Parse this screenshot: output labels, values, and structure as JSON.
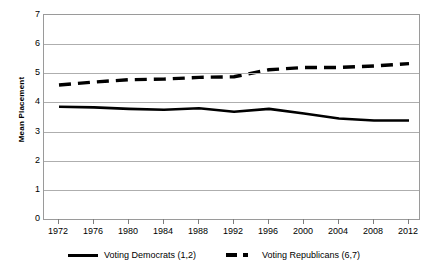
{
  "chart_data": {
    "type": "line",
    "title": "",
    "xlabel": "",
    "ylabel": "Mean Placement",
    "categories": [
      "1972",
      "1976",
      "1980",
      "1984",
      "1988",
      "1992",
      "1996",
      "2000",
      "2004",
      "2008",
      "2012"
    ],
    "x": [
      1972,
      1976,
      1980,
      1984,
      1988,
      1992,
      1996,
      2000,
      2004,
      2008,
      2012
    ],
    "xlim": [
      1970,
      2014
    ],
    "ylim": [
      0,
      7
    ],
    "y_ticks": [
      0,
      1,
      2,
      3,
      4,
      5,
      6,
      7
    ],
    "grid": "horizontal",
    "legend_position": "bottom",
    "series": [
      {
        "name": "Voting Democrats (1,2)",
        "style": "solid",
        "color": "#000000",
        "values": [
          3.85,
          3.83,
          3.78,
          3.75,
          3.8,
          3.68,
          3.78,
          3.62,
          3.45,
          3.38,
          3.38
        ]
      },
      {
        "name": "Voting Republicans (6,7)",
        "style": "dashed",
        "color": "#000000",
        "values": [
          4.6,
          4.7,
          4.78,
          4.8,
          4.86,
          4.88,
          5.12,
          5.2,
          5.2,
          5.25,
          5.33
        ]
      }
    ]
  },
  "axes": {
    "y_title": "Mean Placement",
    "y_tick_labels": [
      "7",
      "6",
      "5",
      "4",
      "3",
      "2",
      "1",
      "0"
    ],
    "x_tick_labels": [
      "1972",
      "1976",
      "1980",
      "1984",
      "1988",
      "1992",
      "1996",
      "2000",
      "2004",
      "2008",
      "2012"
    ]
  },
  "legend": {
    "entries": [
      {
        "label": "Voting Democrats (1,2)",
        "style": "solid"
      },
      {
        "label": "Voting Republicans (6,7)",
        "style": "dashed"
      }
    ]
  },
  "colors": {
    "series_line": "#000000",
    "gridline": "#aeaeae",
    "frame": "#9a9a9a",
    "plot_background": "#ffffff",
    "page_background": "#ffffff"
  }
}
